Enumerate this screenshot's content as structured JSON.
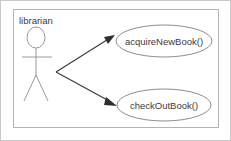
{
  "diagram": {
    "type": "uml-use-case-diagram",
    "actor": {
      "name": "librarian",
      "icon": "stick-figure-actor"
    },
    "use_cases": [
      {
        "id": "uc1",
        "label": "acquireNewBook()"
      },
      {
        "id": "uc2",
        "label": "checkOutBook()"
      }
    ],
    "associations": [
      {
        "from": "librarian",
        "to": "acquireNewBook()",
        "arrow": "filled-arrowhead"
      },
      {
        "from": "librarian",
        "to": "checkOutBook()",
        "arrow": "filled-arrowhead"
      }
    ],
    "colors": {
      "shape_stroke": "#8d8d8d",
      "line_stroke": "#3a3a3a",
      "text": "#3b3b3b",
      "boundary": "#b4b4b4",
      "frame": "#c9c9c9",
      "background": "#ffffff"
    }
  }
}
